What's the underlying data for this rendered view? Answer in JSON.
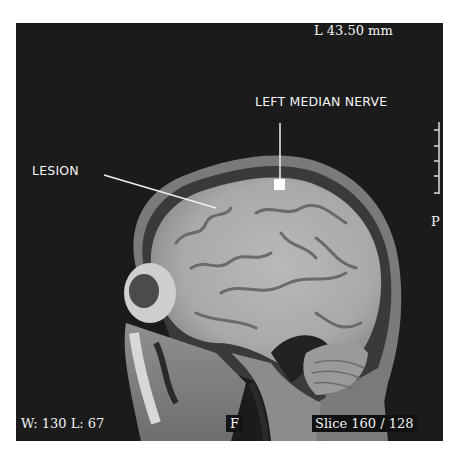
{
  "viewer": {
    "scale_label": "L  43.50 mm",
    "orientation_right": "P",
    "window_label": "W:  130 L:   67",
    "orientation_bottom": "F",
    "slice_label": "Slice 160 / 128"
  },
  "annotations": {
    "lesion": "LESION",
    "nerve": "LEFT MEDIAN NERVE"
  },
  "colors": {
    "background": "#1b1b1b",
    "overlay_text": "#f2f2f2",
    "marker": "#ffffff"
  }
}
